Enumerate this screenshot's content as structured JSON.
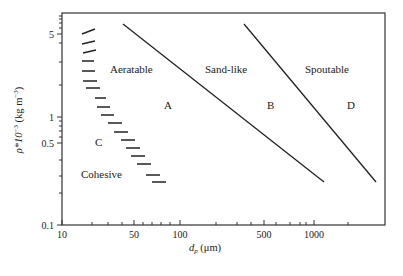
{
  "chart_data": {
    "type": "line",
    "title": "",
    "xlabel": "d_p (μm)",
    "xlabel_main": "d",
    "xlabel_sub": "p",
    "xlabel_unit": " (μm)",
    "ylabel": "ρ*10^-3 (kg m^-3)",
    "ylabel_parts": {
      "rho": "ρ*10",
      "exp1": "−3",
      "unit": " (kg m",
      "exp2": "−3",
      "close": ")"
    },
    "x_scale": "log",
    "y_scale": "log",
    "xlim": [
      10,
      3000
    ],
    "ylim": [
      0.1,
      7
    ],
    "x_ticks": [
      {
        "value": 10,
        "label": "10"
      },
      {
        "value": 50,
        "label": "50"
      },
      {
        "value": 100,
        "label": "100"
      },
      {
        "value": 500,
        "label": "500"
      },
      {
        "value": 1000,
        "label": "1000"
      }
    ],
    "y_ticks": [
      {
        "value": 0.1,
        "label": "0.1"
      },
      {
        "value": 0.5,
        "label": "0.5"
      },
      {
        "value": 1,
        "label": "1"
      },
      {
        "value": 5,
        "label": "5"
      }
    ],
    "grid": false,
    "legend": "none",
    "series": [
      {
        "name": "A-B boundary",
        "style": "solid",
        "points": [
          [
            40,
            6.0
          ],
          [
            1150,
            0.25
          ]
        ]
      },
      {
        "name": "B-D boundary",
        "style": "solid",
        "points": [
          [
            330,
            6.0
          ],
          [
            2400,
            0.25
          ]
        ]
      },
      {
        "name": "C-A boundary",
        "style": "hatched",
        "points": [
          [
            20,
            5.0
          ],
          [
            20,
            4.2
          ],
          [
            20,
            3.6
          ],
          [
            20,
            3.0
          ],
          [
            20,
            2.5
          ],
          [
            21,
            2.0
          ],
          [
            22,
            1.7
          ],
          [
            25,
            1.35
          ],
          [
            27,
            1.15
          ],
          [
            30,
            0.95
          ],
          [
            33,
            0.8
          ],
          [
            37,
            0.68
          ],
          [
            41,
            0.56
          ],
          [
            46,
            0.48
          ],
          [
            51,
            0.41
          ],
          [
            58,
            0.34
          ],
          [
            66,
            0.29
          ],
          [
            75,
            0.25
          ]
        ]
      }
    ],
    "annotations": [
      {
        "text": "Aeratable",
        "x": 28,
        "y": 2.2
      },
      {
        "text": "Sand-like",
        "x": 250,
        "y": 2.2
      },
      {
        "text": "Spoutable",
        "x": 900,
        "y": 2.2
      },
      {
        "text": "A",
        "x": 75,
        "y": 1.1
      },
      {
        "text": "B",
        "x": 470,
        "y": 1.1
      },
      {
        "text": "D",
        "x": 1500,
        "y": 1.1
      },
      {
        "text": "C",
        "x": 25,
        "y": 0.5
      },
      {
        "text": "Cohesive",
        "x": 20,
        "y": 0.28
      }
    ]
  },
  "layout": {
    "plot": {
      "left": 62,
      "top": 13,
      "right": 385,
      "bottom": 225
    },
    "x_tick_px": {
      "10": 62,
      "20": 92,
      "30": 108,
      "40": 122,
      "50": 134,
      "60": 143,
      "70": 152,
      "80": 161,
      "90": 170,
      "100": 180,
      "200": 216,
      "300": 237,
      "400": 251,
      "500": 264,
      "600": 276,
      "700": 290,
      "800": 300,
      "900": 306,
      "1000": 314,
      "2000": 348
    },
    "y_tick_px": {
      "0.1": 225,
      "0.2": 193,
      "0.3": 176,
      "0.4": 160,
      "0.5": 143,
      "0.6": 137,
      "0.7": 131,
      "0.8": 126,
      "0.9": 121,
      "1": 117,
      "2": 85,
      "3": 62,
      "4": 43,
      "5": 34,
      "6": 28,
      "7": 23,
      "8": 19,
      "9": 16
    },
    "lines_px": [
      [
        [
          123,
          24
        ],
        [
          324,
          182
        ]
      ],
      [
        [
          244,
          24
        ],
        [
          376,
          182
        ]
      ]
    ],
    "hatch_px": [
      [
        82,
        34,
        95,
        29
      ],
      [
        82,
        44,
        95,
        41
      ],
      [
        83,
        53,
        96,
        50
      ],
      [
        82,
        61,
        94,
        61
      ],
      [
        82,
        71,
        95,
        71
      ],
      [
        83,
        81,
        97,
        81
      ],
      [
        86,
        88,
        100,
        88
      ],
      [
        95,
        98,
        106,
        98
      ],
      [
        97,
        107,
        110,
        107
      ],
      [
        101,
        115,
        114,
        115
      ],
      [
        108,
        123,
        122,
        123
      ],
      [
        114,
        132,
        128,
        132
      ],
      [
        121,
        140,
        135,
        140
      ],
      [
        126,
        148,
        140,
        148
      ],
      [
        131,
        156,
        145,
        156
      ],
      [
        137,
        164,
        151,
        164
      ],
      [
        146,
        175,
        160,
        175
      ],
      [
        152,
        182,
        166,
        182
      ]
    ],
    "labels_px": [
      {
        "i": 0,
        "x": 110,
        "y": 73
      },
      {
        "i": 1,
        "x": 205,
        "y": 73
      },
      {
        "i": 2,
        "x": 305,
        "y": 73
      },
      {
        "i": 3,
        "x": 164,
        "y": 109
      },
      {
        "i": 4,
        "x": 267,
        "y": 109
      },
      {
        "i": 5,
        "x": 347,
        "y": 109
      },
      {
        "i": 6,
        "x": 95,
        "y": 146
      },
      {
        "i": 7,
        "x": 81,
        "y": 178
      }
    ]
  }
}
